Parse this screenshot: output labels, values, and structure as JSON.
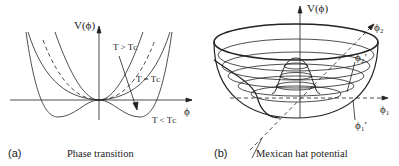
{
  "panel_a": {
    "tag": "(a)",
    "caption": "Phase transition",
    "y_axis_label": "V(ϕ)",
    "x_axis_label": "ϕ",
    "curve_labels": {
      "above": "T > Tᴄ",
      "critical": "T = Tᴄ",
      "below": "T < Tᴄ"
    }
  },
  "panel_b": {
    "tag": "(b)",
    "caption": "Mexican hat potential",
    "y_axis_label": "V(ϕ)",
    "axis_phi1": "ϕ₁",
    "axis_phi2": "ϕ₂",
    "vev_phi1": "ϕ₁'",
    "vev_phi2": "ϕ₂'"
  },
  "colors": {
    "line": "#222222",
    "background": "#ffffff"
  }
}
